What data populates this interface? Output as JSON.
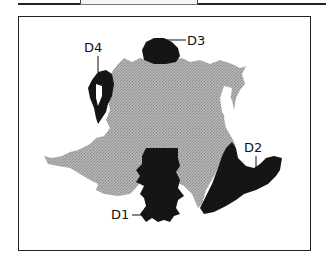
{
  "figure": {
    "title": "",
    "labels": {
      "d1": "D1",
      "d2": "D2",
      "d3": "D3",
      "d4": "D4"
    },
    "colors": {
      "frame": "#222222",
      "gray_region": "#a8a8a8",
      "dark_region": "#151515",
      "background": "#ffffff"
    }
  }
}
